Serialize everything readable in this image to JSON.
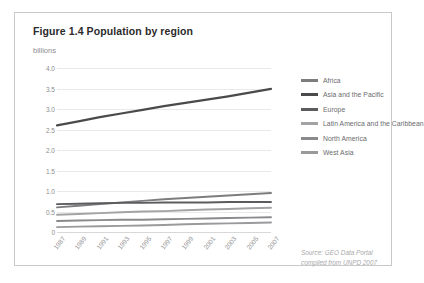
{
  "figure": {
    "title": "Figure 1.4 Population by region",
    "unit_label": "billions",
    "source_line_1": "Source: GEO Data Portal",
    "source_line_2": "compiled from UNPD 2007"
  },
  "chart_data": {
    "type": "line",
    "title": "Figure 1.4 Population by region",
    "xlabel": "",
    "ylabel": "billions",
    "ylim": [
      0,
      4.0
    ],
    "yticks": [
      "0",
      "0.5",
      "1.0",
      "1.5",
      "2.0",
      "2.5",
      "3.0",
      "3.5",
      "4.0"
    ],
    "ytick_values": [
      0,
      0.5,
      1.0,
      1.5,
      2.0,
      2.5,
      3.0,
      3.5,
      4.0
    ],
    "grid": true,
    "legend_position": "right",
    "x": [
      1987,
      1989,
      1991,
      1993,
      1995,
      1997,
      1999,
      2001,
      2003,
      2005,
      2007
    ],
    "categories": [
      "1987",
      "1989",
      "1991",
      "1993",
      "1995",
      "1997",
      "1999",
      "2001",
      "2003",
      "2005",
      "2007"
    ],
    "series": [
      {
        "name": "Africa",
        "color": "#7d7d80",
        "values": [
          0.6,
          0.64,
          0.68,
          0.72,
          0.76,
          0.8,
          0.83,
          0.86,
          0.89,
          0.92,
          0.95
        ]
      },
      {
        "name": "Asia and the Pacific",
        "color": "#4a4a4d",
        "values": [
          2.6,
          2.7,
          2.8,
          2.89,
          2.98,
          3.07,
          3.15,
          3.23,
          3.31,
          3.4,
          3.49
        ]
      },
      {
        "name": "Europe",
        "color": "#5c5c5f",
        "values": [
          0.68,
          0.69,
          0.7,
          0.71,
          0.71,
          0.72,
          0.72,
          0.72,
          0.73,
          0.73,
          0.73
        ]
      },
      {
        "name": "Latin America and the Caribbean",
        "color": "#a3a3a6",
        "values": [
          0.42,
          0.44,
          0.46,
          0.48,
          0.5,
          0.51,
          0.53,
          0.55,
          0.56,
          0.58,
          0.59
        ]
      },
      {
        "name": "North America",
        "color": "#8a8a8d",
        "values": [
          0.27,
          0.28,
          0.29,
          0.3,
          0.3,
          0.31,
          0.32,
          0.33,
          0.34,
          0.35,
          0.36
        ]
      },
      {
        "name": "West Asia",
        "color": "#9a9a9d",
        "values": [
          0.12,
          0.13,
          0.14,
          0.15,
          0.16,
          0.17,
          0.19,
          0.2,
          0.21,
          0.22,
          0.23
        ]
      }
    ]
  },
  "legend": {
    "items": [
      {
        "label": "Africa",
        "color": "#7d7d80"
      },
      {
        "label": "Asia and the Pacific",
        "color": "#4a4a4d"
      },
      {
        "label": "Europe",
        "color": "#5c5c5f"
      },
      {
        "label": "Latin America and the Caribbean",
        "color": "#a3a3a6"
      },
      {
        "label": "North America",
        "color": "#8a8a8d"
      },
      {
        "label": "West Asia",
        "color": "#9a9a9d"
      }
    ]
  }
}
